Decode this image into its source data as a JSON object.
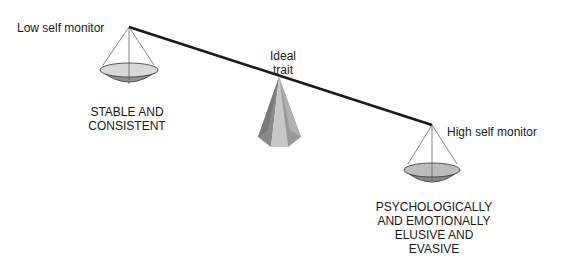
{
  "labels": {
    "low": "Low self monitor",
    "high": "High self monitor",
    "ideal_line1": "Ideal",
    "ideal_line2": "trait",
    "left_desc_line1": "STABLE AND",
    "left_desc_line2": "CONSISTENT",
    "right_desc_line1": "PSYCHOLOGICALLY",
    "right_desc_line2": "AND EMOTIONALLY",
    "right_desc_line3": "ELUSIVE AND",
    "right_desc_line4": "EVASIVE"
  },
  "colors": {
    "beam": "#1a1a1a",
    "pan_top": "#d8d8d8",
    "pan_bottom": "#909090",
    "pyramid_dark": "#8a8a8a",
    "pyramid_light": "#c8c8c8"
  }
}
